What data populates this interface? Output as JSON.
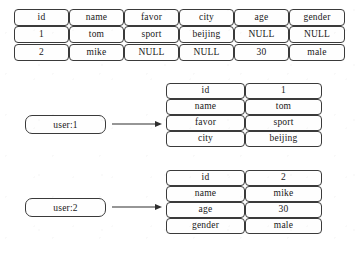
{
  "diagram": {
    "ink_color": "#2e2e2e",
    "paper_color": "#ffffff"
  },
  "wide_table": {
    "name": "user-relational-table",
    "columns": [
      "id",
      "name",
      "favor",
      "city",
      "age",
      "gender"
    ],
    "rows": [
      [
        "1",
        "tom",
        "sport",
        "beijing",
        "NULL",
        "NULL"
      ],
      [
        "2",
        "mike",
        "NULL",
        "NULL",
        "30",
        "male"
      ]
    ]
  },
  "mappings": [
    {
      "key_label": "user:1",
      "arrow": "arrow-right-icon",
      "fields": [
        {
          "field": "id",
          "value": "1"
        },
        {
          "field": "name",
          "value": "tom"
        },
        {
          "field": "favor",
          "value": "sport"
        },
        {
          "field": "city",
          "value": "beijing"
        }
      ]
    },
    {
      "key_label": "user:2",
      "arrow": "arrow-right-icon",
      "fields": [
        {
          "field": "id",
          "value": "2"
        },
        {
          "field": "name",
          "value": "mike"
        },
        {
          "field": "age",
          "value": "30"
        },
        {
          "field": "gender",
          "value": "male"
        }
      ]
    }
  ]
}
